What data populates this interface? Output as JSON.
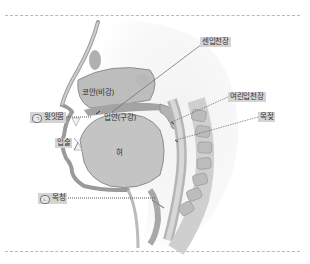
{
  "diagram": {
    "labels": {
      "hard_palate": "센입천장",
      "nasal_cavity": "코안(비강)",
      "upper_gum": "윗잇몸",
      "upper_gum_marker": "ㄱ",
      "oral_cavity": "입안(구강)",
      "soft_palate": "여린입천장",
      "uvula": "목젖",
      "lips": "입술",
      "tongue": "혀",
      "vocal_cords": "목청",
      "vocal_cords_marker": "ㄴ"
    },
    "colors": {
      "label_bg": "#d4d4d4",
      "tissue_light": "#e6e6e6",
      "tissue_mid": "#c9c9c9",
      "tissue_dark": "#a8a8a8",
      "divider": "#b8b8b8"
    }
  }
}
